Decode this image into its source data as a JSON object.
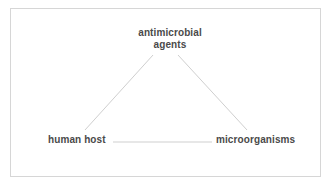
{
  "diagram": {
    "type": "triangle",
    "nodes": [
      {
        "id": "top",
        "label_line1": "antimicrobial",
        "label_line2": "agents"
      },
      {
        "id": "left",
        "label": "human host"
      },
      {
        "id": "right",
        "label": "microorganisms"
      }
    ],
    "edges": [
      {
        "from": "top",
        "to": "left"
      },
      {
        "from": "top",
        "to": "right"
      },
      {
        "from": "left",
        "to": "right"
      }
    ],
    "colors": {
      "text": "#4a4a4a",
      "line": "#cfcfcf",
      "border": "#d6d6d6",
      "background": "#ffffff"
    }
  }
}
